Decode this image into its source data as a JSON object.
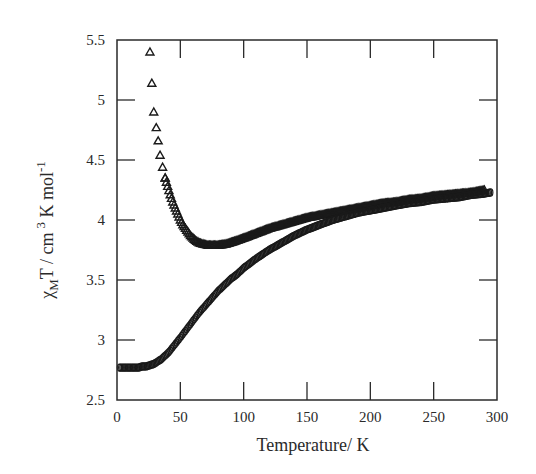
{
  "chart_data": {
    "type": "scatter",
    "title": "",
    "xlabel": "Temperature/  K",
    "ylabel": "χMT / cm 3 K mol-1",
    "ylabel_parts": {
      "chi": "χ",
      "sub": "M",
      "rest": "T / cm",
      "sup3": "3",
      "rest2": " K mol",
      "supneg1": "-1"
    },
    "xlim": [
      0,
      300
    ],
    "ylim": [
      2.5,
      5.5
    ],
    "xticks": [
      0,
      50,
      100,
      150,
      200,
      250,
      300
    ],
    "yticks": [
      2.5,
      3,
      3.5,
      4,
      4.5,
      5,
      5.5
    ],
    "ytick_labels": [
      "2.5",
      "3",
      "3.5",
      "4",
      "4.5",
      "5",
      "5.5"
    ],
    "grid": false,
    "legend": null,
    "series": [
      {
        "name": "triangles",
        "marker": "triangle-open",
        "color": "#1a1a1a",
        "x": [
          26,
          27.5,
          29,
          31,
          32.5,
          34,
          36,
          38,
          40,
          42,
          44,
          46,
          48,
          50,
          52,
          54,
          56,
          58,
          60,
          62,
          65,
          68,
          72,
          76,
          80,
          86,
          92,
          100,
          110,
          120,
          130,
          140,
          150,
          160,
          170,
          180,
          190,
          200,
          210,
          220,
          230,
          240,
          250,
          260,
          270,
          280,
          290
        ],
        "y": [
          5.4,
          5.14,
          4.9,
          4.77,
          4.66,
          4.54,
          4.44,
          4.35,
          4.28,
          4.21,
          4.15,
          4.1,
          4.05,
          4.0,
          3.96,
          3.93,
          3.9,
          3.87,
          3.85,
          3.83,
          3.81,
          3.8,
          3.79,
          3.79,
          3.79,
          3.8,
          3.82,
          3.85,
          3.89,
          3.93,
          3.96,
          3.99,
          4.02,
          4.04,
          4.06,
          4.08,
          4.1,
          4.12,
          4.14,
          4.15,
          4.17,
          4.18,
          4.2,
          4.21,
          4.22,
          4.23,
          4.25
        ]
      },
      {
        "name": "circles",
        "marker": "circle-open",
        "color": "#1a1a1a",
        "x": [
          2,
          5,
          8,
          11,
          14,
          17,
          20,
          23,
          26,
          29,
          32,
          35,
          38,
          41,
          44,
          47,
          50,
          55,
          60,
          65,
          70,
          75,
          80,
          85,
          90,
          95,
          100,
          110,
          120,
          130,
          140,
          150,
          160,
          170,
          180,
          190,
          200,
          210,
          220,
          230,
          240,
          250,
          260,
          270,
          280,
          290,
          295
        ],
        "y": [
          2.77,
          2.77,
          2.77,
          2.77,
          2.77,
          2.77,
          2.78,
          2.78,
          2.79,
          2.8,
          2.82,
          2.84,
          2.87,
          2.9,
          2.94,
          2.98,
          3.02,
          3.09,
          3.16,
          3.23,
          3.29,
          3.35,
          3.41,
          3.46,
          3.51,
          3.55,
          3.6,
          3.68,
          3.75,
          3.81,
          3.87,
          3.92,
          3.96,
          4.0,
          4.03,
          4.06,
          4.08,
          4.1,
          4.12,
          4.14,
          4.15,
          4.17,
          4.18,
          4.19,
          4.21,
          4.22,
          4.23
        ]
      }
    ]
  }
}
